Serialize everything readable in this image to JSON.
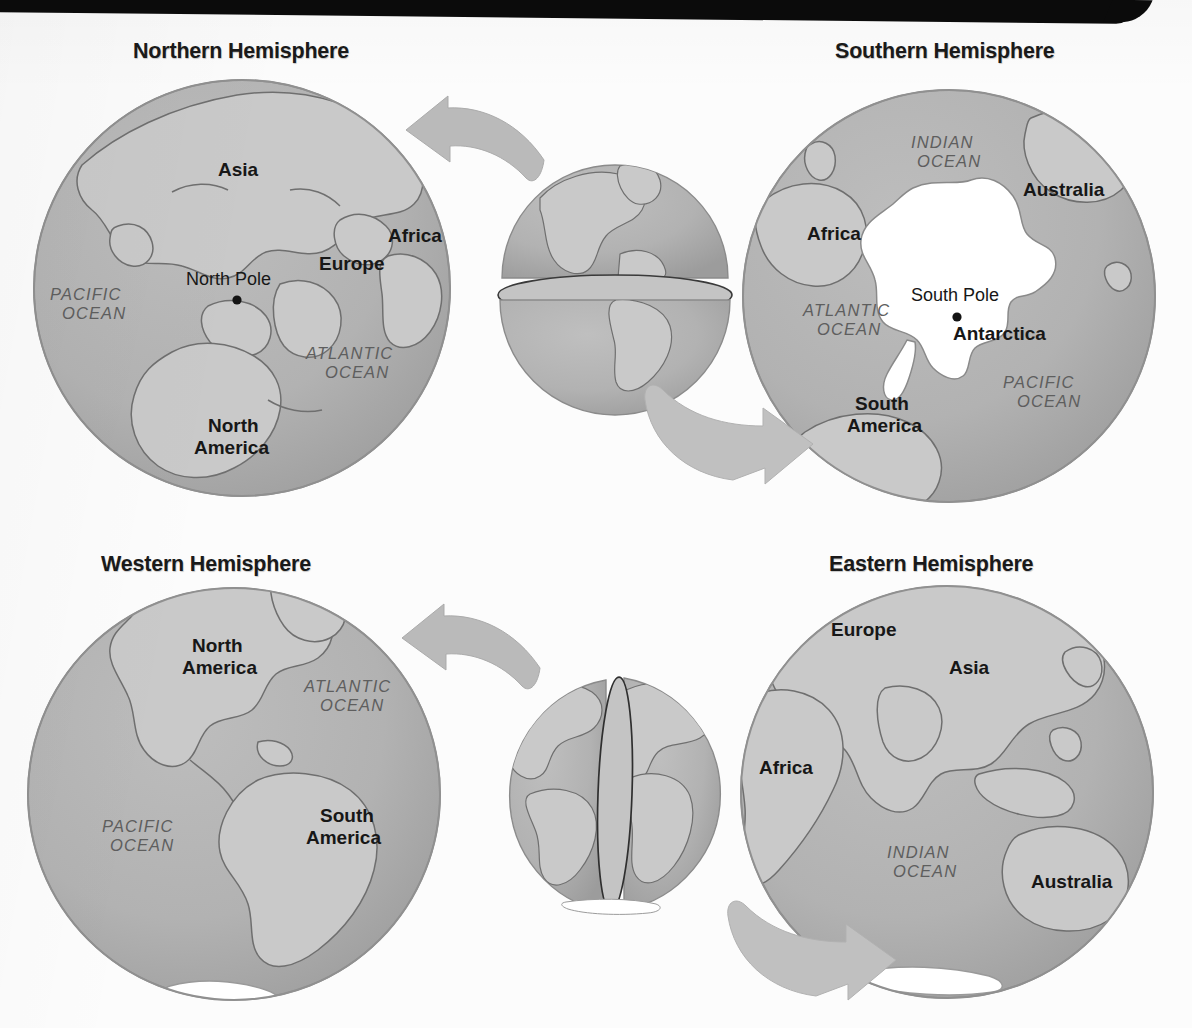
{
  "page": {
    "background_color": "#fcfcfc",
    "artifact": {
      "name": "scan-bar",
      "color": "#0b0b0b"
    }
  },
  "palette": {
    "ocean": "#b0b0b0",
    "land": "#c9c9c9",
    "coastline": "#6f6f6f",
    "globe_edge": "#8e8e8e",
    "ice": "#ffffff",
    "arrow": "#b9b9b9",
    "arrow_edge": "#a6a6a6",
    "label_dark": "#171717",
    "label_ocean": "#5e5e5e"
  },
  "figure": {
    "type": "diagram",
    "panels": [
      {
        "id": "northern",
        "title": "Northern Hemisphere",
        "view": "north-polar",
        "pole_label": "North Pole",
        "labels": [
          {
            "text": "Asia",
            "style": "bold"
          },
          {
            "text": "Africa",
            "style": "bold"
          },
          {
            "text": "Europe",
            "style": "bold"
          },
          {
            "text": "North",
            "style": "bold"
          },
          {
            "text": "America",
            "style": "bold"
          },
          {
            "text": "North Pole",
            "style": "plain"
          },
          {
            "text": "PACIFIC",
            "style": "ocean"
          },
          {
            "text": "OCEAN",
            "style": "ocean"
          },
          {
            "text": "ATLANTIC",
            "style": "ocean"
          },
          {
            "text": "OCEAN",
            "style": "ocean"
          }
        ]
      },
      {
        "id": "southern",
        "title": "Southern Hemisphere",
        "view": "south-polar",
        "pole_label": "South Pole",
        "labels": [
          {
            "text": "INDIAN",
            "style": "ocean"
          },
          {
            "text": "OCEAN",
            "style": "ocean"
          },
          {
            "text": "Australia",
            "style": "bold"
          },
          {
            "text": "Africa",
            "style": "bold"
          },
          {
            "text": "South Pole",
            "style": "plain"
          },
          {
            "text": "Antarctica",
            "style": "bold"
          },
          {
            "text": "ATLANTIC",
            "style": "ocean"
          },
          {
            "text": "OCEAN",
            "style": "ocean"
          },
          {
            "text": "PACIFIC",
            "style": "ocean"
          },
          {
            "text": "OCEAN",
            "style": "ocean"
          },
          {
            "text": "South",
            "style": "bold"
          },
          {
            "text": "America",
            "style": "bold"
          }
        ]
      },
      {
        "id": "western",
        "title": "Western Hemisphere",
        "view": "americas",
        "labels": [
          {
            "text": "North",
            "style": "bold"
          },
          {
            "text": "America",
            "style": "bold"
          },
          {
            "text": "ATLANTIC",
            "style": "ocean"
          },
          {
            "text": "OCEAN",
            "style": "ocean"
          },
          {
            "text": "PACIFIC",
            "style": "ocean"
          },
          {
            "text": "OCEAN",
            "style": "ocean"
          },
          {
            "text": "South",
            "style": "bold"
          },
          {
            "text": "America",
            "style": "bold"
          }
        ]
      },
      {
        "id": "eastern",
        "title": "Eastern Hemisphere",
        "view": "afro-eurasia",
        "labels": [
          {
            "text": "Europe",
            "style": "bold"
          },
          {
            "text": "Asia",
            "style": "bold"
          },
          {
            "text": "Africa",
            "style": "bold"
          },
          {
            "text": "INDIAN",
            "style": "ocean"
          },
          {
            "text": "OCEAN",
            "style": "ocean"
          },
          {
            "text": "Australia",
            "style": "bold"
          }
        ]
      }
    ],
    "center_globes": [
      {
        "id": "split-equator",
        "name": "globe-split-by-equator",
        "split": "horizontal",
        "line": "equator"
      },
      {
        "id": "split-meridian",
        "name": "globe-split-by-prime-meridian",
        "split": "vertical",
        "line": "prime meridian"
      }
    ],
    "arrows": [
      {
        "id": "to-northern",
        "name": "arrow-to-northern-hemisphere",
        "direction": "up-left"
      },
      {
        "id": "to-southern",
        "name": "arrow-to-southern-hemisphere",
        "direction": "down-right"
      },
      {
        "id": "to-western",
        "name": "arrow-to-western-hemisphere",
        "direction": "up-left"
      },
      {
        "id": "to-eastern",
        "name": "arrow-to-eastern-hemisphere",
        "direction": "down-right"
      }
    ]
  },
  "labels": {
    "asia": "Asia",
    "africa": "Africa",
    "europe": "Europe",
    "north": "North",
    "america": "America",
    "south": "South",
    "australia": "Australia",
    "antarctica": "Antarctica",
    "north_pole": "North Pole",
    "south_pole": "South Pole",
    "pacific": "PACIFIC",
    "atlantic": "ATLANTIC",
    "indian": "INDIAN",
    "ocean": "OCEAN"
  }
}
